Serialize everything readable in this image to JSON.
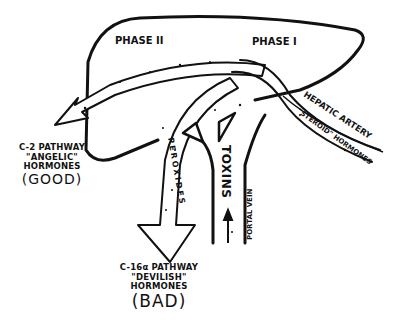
{
  "diagram": {
    "liver": {
      "phase_2_label": "PHASE II",
      "phase_1_label": "PHASE I"
    },
    "vessels": {
      "hepatic_artery_label": "HEPATIC ARTERY",
      "steroid_hormones_label": "\"STEROID\" HORMONES",
      "portal_vein_label": "PORTAL VEIN",
      "toxins_label": "TOXINS",
      "peroxides_label": "PEROXIDES"
    },
    "outputs": {
      "good": {
        "line1": "C-2 PATHWAY",
        "line2": "\"ANGELIC\"",
        "line3": "HORMONES",
        "verdict": "(GOOD)"
      },
      "bad": {
        "line1": "C-16α PATHWAY",
        "line2": "\"DEVILISH\"",
        "line3": "HORMONES",
        "verdict": "(BAD)"
      }
    },
    "colors": {
      "ink": "#111111",
      "paper": "#ffffff"
    }
  }
}
